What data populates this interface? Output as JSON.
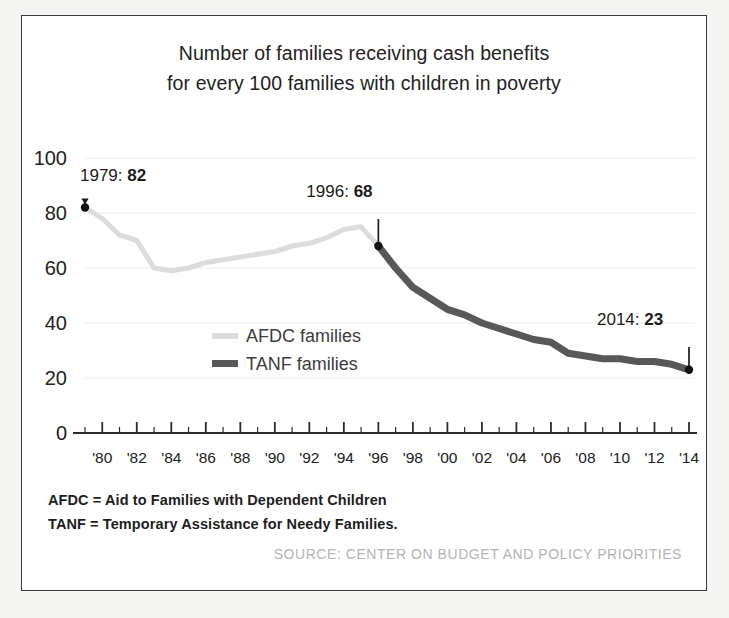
{
  "figure": {
    "background_color": "#ffffff",
    "frame_color": "#3a3a3a",
    "title_line1": "Number of families receiving cash benefits",
    "title_line2": "for every 100 families with children in poverty"
  },
  "legend": {
    "afdc_label": "AFDC families",
    "afdc_color": "#dcdcdc",
    "tanf_label": "TANF families",
    "tanf_color": "#585858"
  },
  "annotations": [
    {
      "name": "annotation-1979",
      "text": "1979: 82",
      "year": 1979,
      "value": 82
    },
    {
      "name": "annotation-1996",
      "text": "1996: 68",
      "year": 1996,
      "value": 68
    },
    {
      "name": "annotation-2014",
      "text": "2014: 23",
      "year": 2014,
      "value": 23
    }
  ],
  "footnotes": {
    "afdc": "AFDC = Aid to Families with Dependent Children",
    "tanf": "TANF = Temporary Assistance for Needy Families."
  },
  "source": "SOURCE: CENTER ON BUDGET AND POLICY PRIORITIES",
  "chart_data": {
    "type": "line",
    "title": "Number of families receiving cash benefits for every 100 families with children in poverty",
    "xlabel": "",
    "ylabel": "",
    "xlim": [
      1979,
      2014
    ],
    "ylim": [
      0,
      100
    ],
    "yticks": [
      0,
      20,
      40,
      60,
      80,
      100
    ],
    "xticks": [
      1980,
      1982,
      1984,
      1986,
      1988,
      1990,
      1992,
      1994,
      1996,
      1998,
      2000,
      2002,
      2004,
      2006,
      2008,
      2010,
      2012,
      2014
    ],
    "xticklabels": [
      "'80",
      "'82",
      "'84",
      "'86",
      "'88",
      "'90",
      "'92",
      "'94",
      "'96",
      "'98",
      "'00",
      "'02",
      "'04",
      "'06",
      "'08",
      "'10",
      "'12",
      "'14"
    ],
    "grid": "horizontal",
    "legend_position": "center-left",
    "series": [
      {
        "name": "AFDC families",
        "color": "#dcdcdc",
        "x": [
          1979,
          1980,
          1981,
          1982,
          1983,
          1984,
          1985,
          1986,
          1987,
          1988,
          1989,
          1990,
          1991,
          1992,
          1993,
          1994,
          1995,
          1996
        ],
        "values": [
          82,
          78,
          72,
          70,
          60,
          59,
          60,
          62,
          63,
          64,
          65,
          66,
          68,
          69,
          71,
          74,
          75,
          68
        ]
      },
      {
        "name": "TANF families",
        "color": "#585858",
        "x": [
          1996,
          1997,
          1998,
          1999,
          2000,
          2001,
          2002,
          2003,
          2004,
          2005,
          2006,
          2007,
          2008,
          2009,
          2010,
          2011,
          2012,
          2013,
          2014
        ],
        "values": [
          68,
          60,
          53,
          49,
          45,
          43,
          40,
          38,
          36,
          34,
          33,
          29,
          28,
          27,
          27,
          26,
          26,
          25,
          23
        ]
      }
    ]
  }
}
